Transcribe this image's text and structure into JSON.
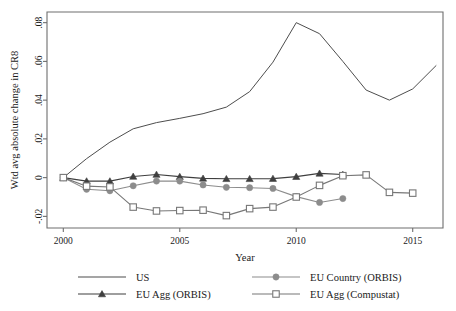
{
  "chart_data": {
    "type": "line",
    "title": "",
    "xlabel": "Year",
    "ylabel": "Wtd avg absolute change in CR8",
    "xlim": [
      1999.3,
      2016.3
    ],
    "ylim": [
      -0.026,
      0.0855
    ],
    "xticks": [
      2000,
      2005,
      2010,
      2015
    ],
    "xticklabels": [
      "2000",
      "2005",
      "2010",
      "2015"
    ],
    "yticks": [
      -0.02,
      0,
      0.02,
      0.04,
      0.06,
      0.08
    ],
    "yticklabels": [
      "-.02",
      "0",
      ".02",
      ".04",
      ".06",
      ".08"
    ],
    "grid": false,
    "legend_position": "below",
    "series": [
      {
        "name": "US",
        "marker": "none",
        "color": "#4d4d4d",
        "x": [
          2000,
          2001,
          2002,
          2003,
          2004,
          2005,
          2006,
          2007,
          2008,
          2009,
          2010,
          2011,
          2012,
          2013,
          2014,
          2015,
          2016
        ],
        "y": [
          0.0,
          0.0098,
          0.0183,
          0.0252,
          0.0284,
          0.0306,
          0.033,
          0.0364,
          0.0444,
          0.0596,
          0.08,
          0.0743,
          0.06,
          0.0452,
          0.04,
          0.0458,
          0.0578
        ]
      },
      {
        "name": "EU Agg (ORBIS)",
        "marker": "triangle",
        "color": "#3f3f3f",
        "x": [
          2000,
          2001,
          2002,
          2003,
          2004,
          2005,
          2006,
          2007,
          2008,
          2009,
          2010,
          2011,
          2012
        ],
        "y": [
          0.0,
          -0.0018,
          -0.0018,
          0.0006,
          0.0016,
          0.0005,
          -0.0004,
          -0.0006,
          -0.0006,
          -0.0005,
          0.0005,
          0.0022,
          0.0016
        ]
      },
      {
        "name": "EU Country (ORBIS)",
        "marker": "circle",
        "color": "#8c8c8c",
        "x": [
          2000,
          2001,
          2002,
          2003,
          2004,
          2005,
          2006,
          2007,
          2008,
          2009,
          2010,
          2011,
          2012
        ],
        "y": [
          0.0,
          -0.006,
          -0.0068,
          -0.0042,
          -0.0018,
          -0.0018,
          -0.0038,
          -0.005,
          -0.0052,
          -0.0056,
          -0.0098,
          -0.0128,
          -0.0108
        ]
      },
      {
        "name": "EU Agg (Compustat)",
        "marker": "square-open",
        "color": "#777777",
        "x": [
          2000,
          2001,
          2002,
          2003,
          2004,
          2005,
          2006,
          2007,
          2008,
          2009,
          2010,
          2011,
          2012,
          2013,
          2014,
          2015
        ],
        "y": [
          0.0,
          -0.0044,
          -0.0048,
          -0.0152,
          -0.0172,
          -0.017,
          -0.0168,
          -0.0196,
          -0.016,
          -0.0152,
          -0.01,
          -0.004,
          0.001,
          0.0014,
          -0.0076,
          -0.008
        ]
      }
    ]
  },
  "legend": {
    "entries": [
      {
        "label": "US",
        "marker": "none"
      },
      {
        "label": "EU Country (ORBIS)",
        "marker": "circle"
      },
      {
        "label": "EU Agg (ORBIS)",
        "marker": "triangle"
      },
      {
        "label": "EU Agg (Compustat)",
        "marker": "square-open"
      }
    ]
  },
  "colors": {
    "us": "#4d4d4d",
    "eu_agg_orbis": "#3f3f3f",
    "eu_country_orbis": "#8c8c8c",
    "eu_agg_compustat": "#777777",
    "axis": "#6e6e6e",
    "background": "#ffffff"
  }
}
